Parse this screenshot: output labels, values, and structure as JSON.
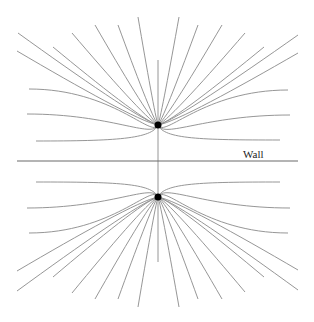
{
  "diagram": {
    "title": "",
    "labels": {
      "wall": "Wall"
    },
    "colors": {
      "background": "#ffffff",
      "field_line": "#8a8a8a",
      "wall": "#6a6a6a",
      "charge": "#000000",
      "label": "#222222"
    },
    "wall": {
      "x1": 17,
      "x2": 298,
      "y": 161,
      "label_x": 243,
      "label_y": 158
    },
    "axis": {
      "x": 158,
      "y1": 60,
      "y2": 262
    },
    "charges": [
      {
        "name": "real-charge",
        "x": 158,
        "y": 125,
        "r": 3.5
      },
      {
        "name": "image-charge",
        "x": 158,
        "y": 197,
        "r": 3.5
      }
    ],
    "field_line_endpoints": {
      "top": [
        [
          18,
          33
        ],
        [
          17,
          51
        ],
        [
          29,
          89
        ],
        [
          27,
          114
        ],
        [
          36,
          141
        ],
        [
          53,
          47
        ],
        [
          72,
          33
        ],
        [
          95,
          25
        ],
        [
          118,
          25
        ],
        [
          138,
          17
        ],
        [
          179,
          17
        ],
        [
          198,
          25
        ],
        [
          222,
          25
        ],
        [
          245,
          33
        ],
        [
          264,
          47
        ],
        [
          298,
          35
        ],
        [
          298,
          53
        ],
        [
          288,
          90
        ],
        [
          290,
          115
        ],
        [
          280,
          140
        ]
      ],
      "bottom": [
        [
          36,
          182
        ],
        [
          27,
          208
        ],
        [
          29,
          233
        ],
        [
          17,
          271
        ],
        [
          17,
          291
        ],
        [
          53,
          277
        ],
        [
          72,
          293
        ],
        [
          95,
          299
        ],
        [
          118,
          299
        ],
        [
          138,
          307
        ],
        [
          280,
          182
        ],
        [
          290,
          208
        ],
        [
          288,
          233
        ],
        [
          298,
          270
        ],
        [
          298,
          290
        ],
        [
          264,
          277
        ],
        [
          245,
          292
        ],
        [
          222,
          299
        ],
        [
          198,
          299
        ],
        [
          179,
          307
        ]
      ]
    }
  }
}
